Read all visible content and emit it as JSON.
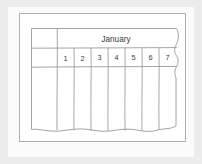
{
  "figure": {
    "kind": "spreadsheet-table-illustration",
    "paper_background_color": "#fbfbfb",
    "mat_background_color": "#ececec",
    "line_color": "#9a9a9a",
    "outer_frame_color": "#b3b3b3",
    "text_color": "#3a3a3a"
  },
  "table": {
    "title": "January",
    "row_header_column": {
      "label": "",
      "is_blank": true
    },
    "column_headers": [
      {
        "label": "1"
      },
      {
        "label": "2"
      },
      {
        "label": "3"
      },
      {
        "label": "4"
      },
      {
        "label": "5"
      },
      {
        "label": "6"
      },
      {
        "label": "7"
      }
    ],
    "body_rows": []
  }
}
